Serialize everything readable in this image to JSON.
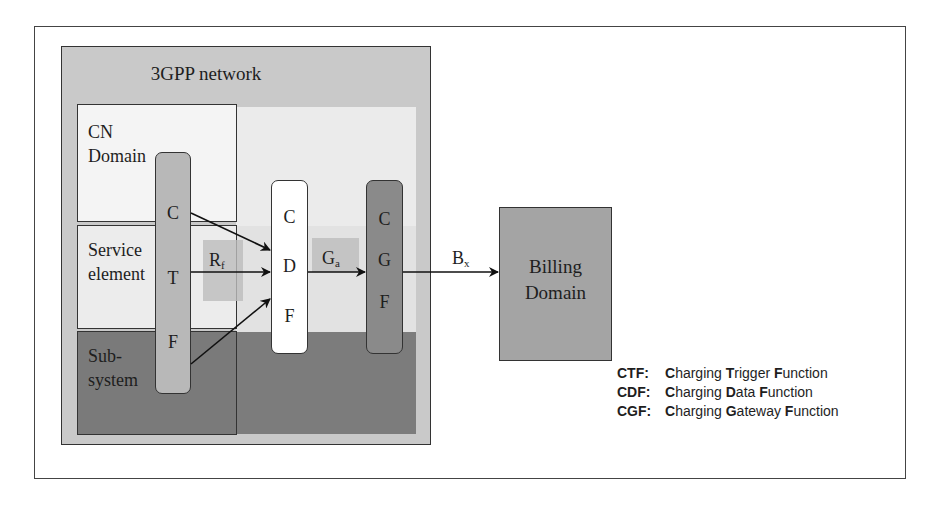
{
  "diagram": {
    "container_title": "3GPP network",
    "domains": [
      {
        "id": "cn",
        "label_lines": [
          "CN",
          "Domain"
        ]
      },
      {
        "id": "service",
        "label_lines": [
          "Service",
          "element"
        ]
      },
      {
        "id": "subsystem",
        "label_lines": [
          "Sub-",
          "system"
        ]
      }
    ],
    "functions": {
      "ctf": {
        "letters": [
          "C",
          "T",
          "F"
        ]
      },
      "cdf": {
        "letters": [
          "C",
          "D",
          "F"
        ]
      },
      "cgf": {
        "letters": [
          "C",
          "G",
          "F"
        ]
      }
    },
    "billing": {
      "label_lines": [
        "Billing",
        "Domain"
      ]
    },
    "interfaces": {
      "rf": {
        "base": "R",
        "sub": "f"
      },
      "ga": {
        "base": "G",
        "sub": "a"
      },
      "bx": {
        "base": "B",
        "sub": "x"
      }
    },
    "edges": [
      {
        "from": "CTF",
        "to": "CDF",
        "via": "Rf",
        "count": 3
      },
      {
        "from": "CDF",
        "to": "CGF",
        "via": "Ga"
      },
      {
        "from": "CGF",
        "to": "Billing Domain",
        "via": "Bx"
      }
    ],
    "legend": [
      {
        "abbr": "CTF:",
        "parts": [
          [
            "C",
            "harging "
          ],
          [
            "T",
            "rigger "
          ],
          [
            "F",
            "unction"
          ]
        ]
      },
      {
        "abbr": "CDF:",
        "parts": [
          [
            "C",
            "harging "
          ],
          [
            "D",
            "ata "
          ],
          [
            "F",
            "unction"
          ]
        ]
      },
      {
        "abbr": "CGF:",
        "parts": [
          [
            "C",
            "harging "
          ],
          [
            "G",
            "ateway "
          ],
          [
            "F",
            "unction"
          ]
        ]
      }
    ],
    "colors": {
      "network_bg": "#c9c9c9",
      "ctf_fill": "#b8b8b8",
      "cdf_fill": "#ffffff",
      "cgf_fill": "#8a8a8a",
      "billing_fill": "#a4a4a4",
      "subsystem_fill": "#7a7a7a"
    }
  }
}
